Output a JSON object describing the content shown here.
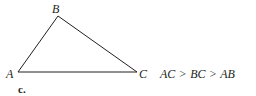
{
  "figure": {
    "part_label": "c.",
    "vertices": {
      "A": {
        "label": "A",
        "x": 18,
        "y": 72
      },
      "B": {
        "label": "B",
        "x": 58,
        "y": 16
      },
      "C": {
        "label": "C",
        "x": 137,
        "y": 72
      }
    },
    "stroke_color": "#231f20"
  },
  "relation": {
    "terms": [
      "AC",
      "BC",
      "AB"
    ],
    "operators": [
      ">",
      ">"
    ],
    "text": "AC > BC > AB"
  }
}
